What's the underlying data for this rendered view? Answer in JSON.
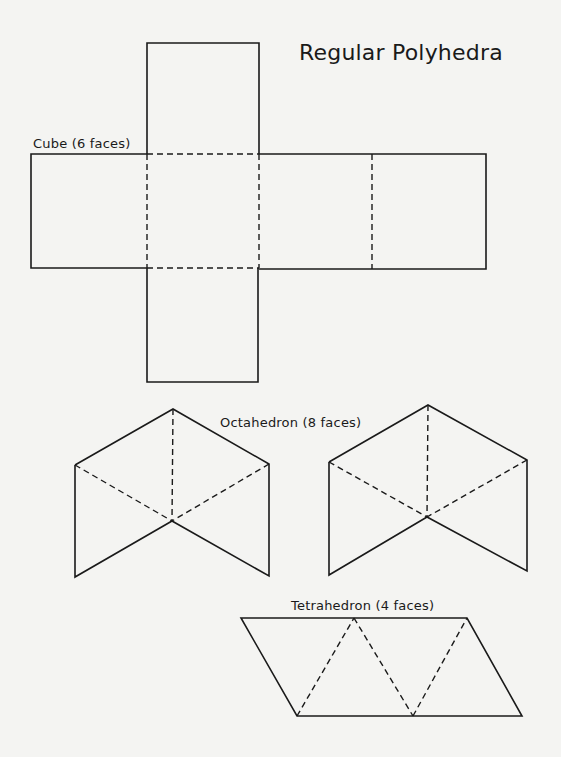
{
  "page": {
    "title": "Regular Polyhedra",
    "background": "#f4f4f2",
    "line_color": "#1a1a1a"
  },
  "figures": {
    "cube": {
      "label": "Cube (6 faces)",
      "faces": 6
    },
    "octahedron": {
      "label": "Octahedron (8 faces)",
      "faces": 8,
      "net_parts": 2
    },
    "tetrahedron": {
      "label": "Tetrahedron (4 faces)",
      "faces": 4
    }
  }
}
